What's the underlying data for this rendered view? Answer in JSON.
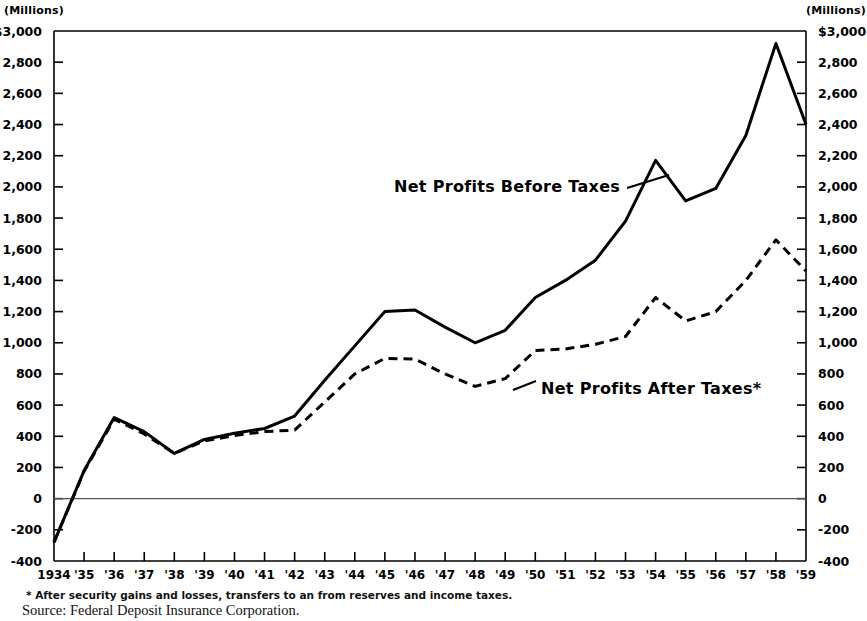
{
  "axes": {
    "left_unit_label": "(Millions)",
    "right_unit_label": "(Millions)",
    "y_tick_labels": [
      "$3,000",
      "2,800",
      "2,600",
      "2,400",
      "2,200",
      "2,000",
      "1,800",
      "1,600",
      "1,400",
      "1,200",
      "1,000",
      "800",
      "600",
      "400",
      "200",
      "0",
      "-200",
      "-400"
    ],
    "y_tick_labels_right": [
      "$3,000",
      "2,800",
      "2,600",
      "2,400",
      "2,200",
      "2,000",
      "1,800",
      "1,600",
      "1,400",
      "1,200",
      "1,000",
      "800",
      "600",
      "400",
      "200",
      "0",
      "-200",
      "-400"
    ],
    "x_tick_labels": [
      "1934",
      "'35",
      "'36",
      "'37",
      "'38",
      "'39",
      "'40",
      "'41",
      "'42",
      "'43",
      "'44",
      "'45",
      "'46",
      "'47",
      "'48",
      "'49",
      "'50",
      "'51",
      "'52",
      "'53",
      "'54",
      "'55",
      "'56",
      "'57",
      "'58",
      "'59"
    ]
  },
  "annotations": {
    "before_taxes_label": "Net Profits Before Taxes",
    "after_taxes_label": "Net Profits After Taxes*"
  },
  "footnotes": {
    "star_note": "* After security gains and losses, transfers to an from reserves and income taxes.",
    "source": "Source: Federal Deposit Insurance Corporation."
  },
  "chart_data": {
    "type": "line",
    "title": "",
    "subtitle": "",
    "xlabel": "",
    "ylabel": "(Millions)",
    "ylim": [
      -400,
      3000
    ],
    "ytick_step": 200,
    "grid": false,
    "legend_position": "inline-annotation",
    "x": [
      1934,
      1935,
      1936,
      1937,
      1938,
      1939,
      1940,
      1941,
      1942,
      1943,
      1944,
      1945,
      1946,
      1947,
      1948,
      1949,
      1950,
      1951,
      1952,
      1953,
      1954,
      1955,
      1956,
      1957,
      1958,
      1959
    ],
    "series": [
      {
        "name": "Net Profits Before Taxes",
        "style": "solid",
        "color": "#000000",
        "values": [
          -280,
          180,
          520,
          430,
          290,
          380,
          420,
          450,
          530,
          760,
          980,
          1200,
          1210,
          1100,
          1000,
          1080,
          1290,
          1400,
          1530,
          1780,
          2170,
          1910,
          1990,
          2330,
          2920,
          2400
        ]
      },
      {
        "name": "Net Profits After Taxes*",
        "style": "dashed",
        "color": "#000000",
        "values": [
          -280,
          175,
          510,
          415,
          290,
          370,
          405,
          430,
          440,
          620,
          800,
          900,
          895,
          800,
          720,
          770,
          950,
          960,
          990,
          1040,
          1290,
          1140,
          1200,
          1400,
          1660,
          1460
        ]
      }
    ]
  },
  "colors": {
    "ink": "#000000",
    "background": "#ffffff",
    "zero_line": "#555555"
  }
}
